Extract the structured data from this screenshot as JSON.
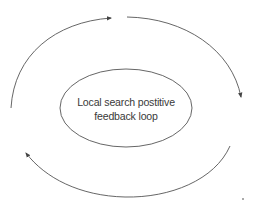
{
  "diagram": {
    "center_label": {
      "line1": "Local search postitive",
      "line2": "feedback loop"
    },
    "colors": {
      "stroke": "#555555",
      "text": "#3a3a3a",
      "background": "#ffffff"
    },
    "arrows": [
      {
        "name": "arrow-top-left",
        "direction": "clockwise",
        "from": "left",
        "to": "top"
      },
      {
        "name": "arrow-top-right",
        "direction": "clockwise",
        "from": "top",
        "to": "right"
      },
      {
        "name": "arrow-bottom",
        "direction": "clockwise",
        "from": "right",
        "to": "left"
      }
    ]
  }
}
